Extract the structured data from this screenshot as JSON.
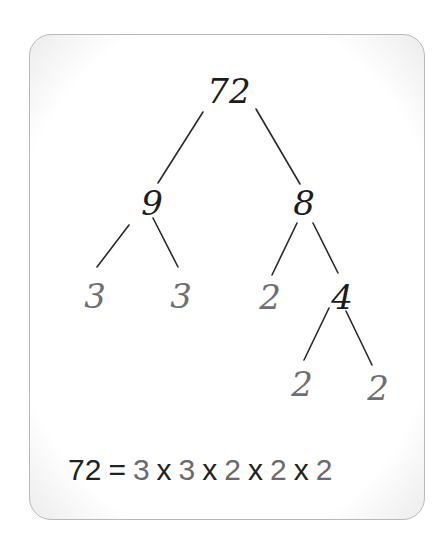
{
  "diagram": {
    "colors": {
      "composite": "#1c1c1c",
      "prime": "#6f6f6f",
      "line": "#2a2a2a",
      "card_border": "#b9b9b9"
    },
    "nodes": {
      "root": "72",
      "left": "9",
      "right": "8",
      "left_left": "3",
      "left_right": "3",
      "right_left": "2",
      "right_right": "4",
      "right_right_left": "2",
      "right_right_right": "2"
    },
    "edges": [
      {
        "from": "72",
        "to": "9"
      },
      {
        "from": "72",
        "to": "8"
      },
      {
        "from": "9",
        "to": "3"
      },
      {
        "from": "9",
        "to": "3"
      },
      {
        "from": "8",
        "to": "2"
      },
      {
        "from": "8",
        "to": "4"
      },
      {
        "from": "4",
        "to": "2"
      },
      {
        "from": "4",
        "to": "2"
      }
    ],
    "equation": {
      "lhs": "72",
      "eq": "=",
      "factors": [
        "3",
        "3",
        "2",
        "2",
        "2"
      ],
      "op": "x"
    }
  }
}
